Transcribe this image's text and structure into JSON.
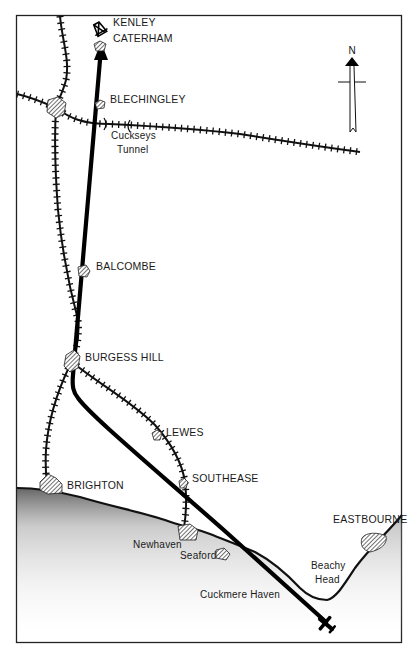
{
  "map": {
    "compass": {
      "label": "N"
    },
    "towns": [
      {
        "name": "KENLEY",
        "x": 113,
        "y": 22
      },
      {
        "name": "CATERHAM",
        "x": 113,
        "y": 38
      },
      {
        "name": "BLECHINGLEY",
        "x": 110,
        "y": 99
      },
      {
        "name": "BALCOMBE",
        "x": 96,
        "y": 266
      },
      {
        "name": "BURGESS HILL",
        "x": 85,
        "y": 357
      },
      {
        "name": "LEWES",
        "x": 166,
        "y": 432
      },
      {
        "name": "SOUTHEASE",
        "x": 192,
        "y": 478
      },
      {
        "name": "BRIGHTON",
        "x": 67,
        "y": 485
      },
      {
        "name": "EASTBOURNE",
        "x": 333,
        "y": 519
      }
    ],
    "places": [
      {
        "name": "Cuckseys",
        "x": 111,
        "y": 136
      },
      {
        "name": "Tunnel",
        "x": 117,
        "y": 150
      },
      {
        "name": "Newhaven",
        "x": 133,
        "y": 545
      },
      {
        "name": "Seaford",
        "x": 180,
        "y": 556
      },
      {
        "name": "Beachy",
        "x": 311,
        "y": 566
      },
      {
        "name": "Head",
        "x": 315,
        "y": 580
      },
      {
        "name": "Cuckmere Haven",
        "x": 200,
        "y": 595
      }
    ]
  }
}
